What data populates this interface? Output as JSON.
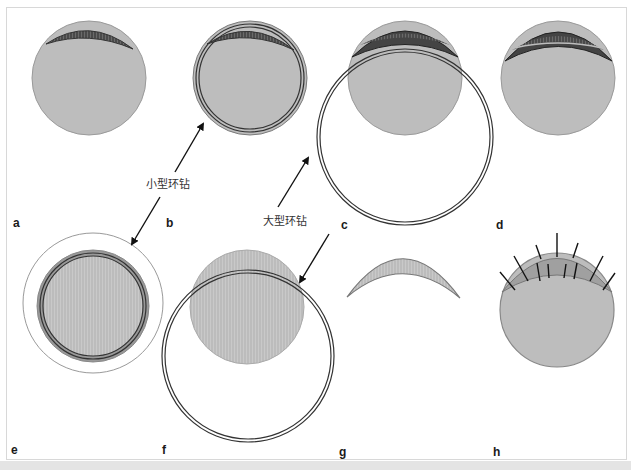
{
  "figure": {
    "type": "surgical-diagram",
    "panels": [
      {
        "id": "a",
        "label": "a"
      },
      {
        "id": "b",
        "label": "b"
      },
      {
        "id": "c",
        "label": "c"
      },
      {
        "id": "d",
        "label": "d"
      },
      {
        "id": "e",
        "label": "e"
      },
      {
        "id": "f",
        "label": "f"
      },
      {
        "id": "g",
        "label": "g"
      },
      {
        "id": "h",
        "label": "h"
      }
    ],
    "annotations": {
      "small_trephine": "小型环钻",
      "large_trephine": "大型环钻"
    },
    "colors": {
      "tissue_fill": "#bdbdbd",
      "tissue_stroke": "#8a8a8a",
      "lesion_fill": "#555555",
      "lesion_stroke": "#333333",
      "graft_fill": "#a8a8a8",
      "ring_stroke": "#3a3a3a",
      "suture": "#111111",
      "arrow": "#111111",
      "frame": "#d8d8d8",
      "band": "#e4e4e4"
    }
  }
}
